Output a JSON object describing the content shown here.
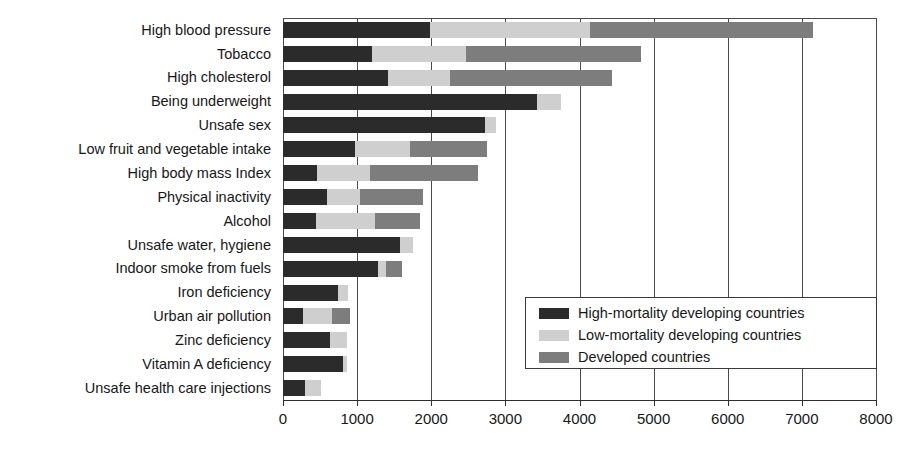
{
  "chart_data": {
    "type": "bar",
    "subtype": "stacked-horizontal-bar",
    "title": "",
    "xlabel": "",
    "ylabel": "",
    "xlim": [
      0,
      8000
    ],
    "ylim": null,
    "grid": true,
    "grid_axis": "x",
    "legend_position": "inside-lower-right",
    "xticks": [
      0,
      1000,
      2000,
      3000,
      4000,
      5000,
      6000,
      7000,
      8000
    ],
    "xtick_labels": [
      "0",
      "1000",
      "2000",
      "3000",
      "4000",
      "5000",
      "6000",
      "7000",
      "8000"
    ],
    "categories": [
      "High blood pressure",
      "Tobacco",
      "High cholesterol",
      "Being underweight",
      "Unsafe sex",
      "Low fruit and vegetable intake",
      "High body mass Index",
      "Physical inactivity",
      "Alcohol",
      "Unsafe water, hygiene",
      "Indoor smoke from fuels",
      "Iron deficiency",
      "Urban air pollution",
      "Zinc deficiency",
      "Vitamin A deficiency",
      "Unsafe health care injections"
    ],
    "series": [
      {
        "name": "High-mortality developing countries",
        "color": "#2b2b2b",
        "values": [
          1980,
          1200,
          1420,
          3430,
          2725,
          970,
          460,
          590,
          450,
          1580,
          1280,
          740,
          270,
          640,
          810,
          300
        ]
      },
      {
        "name": "Low-mortality developing countries",
        "color": "#cfcfcf",
        "values": [
          2160,
          1270,
          830,
          320,
          150,
          740,
          710,
          450,
          790,
          170,
          110,
          140,
          390,
          220,
          50,
          210
        ]
      },
      {
        "name": "Developed countries",
        "color": "#7d7d7d",
        "values": [
          3010,
          2360,
          2190,
          0,
          0,
          1040,
          1460,
          850,
          610,
          0,
          210,
          0,
          240,
          0,
          0,
          0
        ]
      }
    ],
    "totals": [
      7150,
      4830,
      4440,
      3750,
      2875,
      2750,
      2630,
      1890,
      1850,
      1750,
      1600,
      880,
      900,
      860,
      860,
      510
    ]
  },
  "legend": {
    "items": [
      {
        "label": "High-mortality developing countries",
        "swatch": "#2b2b2b"
      },
      {
        "label": "Low-mortality developing countries",
        "swatch": "#cfcfcf"
      },
      {
        "label": "Developed countries",
        "swatch": "#7d7d7d"
      }
    ]
  }
}
